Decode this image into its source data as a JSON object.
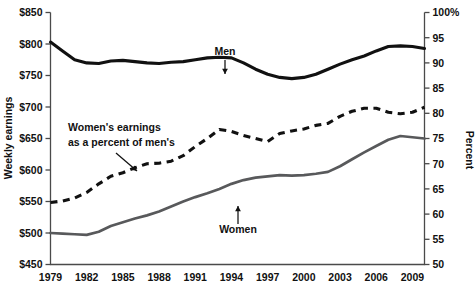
{
  "chart_data": {
    "type": "line",
    "title": "",
    "xlabel": "",
    "ylabel": "Weekly earnings",
    "y2label": "Percent",
    "ylim": [
      450,
      850
    ],
    "y2lim": [
      50,
      100
    ],
    "xlim": [
      1979,
      2010
    ],
    "grid": false,
    "legend_position": "inline-annotations",
    "y_ticks": [
      "$450",
      "$500",
      "$550",
      "$600",
      "$650",
      "$700",
      "$750",
      "$800",
      "$850"
    ],
    "y_tick_values": [
      450,
      500,
      550,
      600,
      650,
      700,
      750,
      800,
      850
    ],
    "y2_ticks": [
      "50",
      "55",
      "60",
      "65",
      "70",
      "75",
      "80",
      "85",
      "90",
      "95",
      "100%"
    ],
    "y2_tick_values": [
      50,
      55,
      60,
      65,
      70,
      75,
      80,
      85,
      90,
      95,
      100
    ],
    "x_ticks": [
      "1979",
      "1982",
      "1985",
      "1988",
      "1991",
      "1994",
      "1997",
      "2000",
      "2003",
      "2006",
      "2009"
    ],
    "x": [
      1979,
      1980,
      1981,
      1982,
      1983,
      1984,
      1985,
      1986,
      1987,
      1988,
      1989,
      1990,
      1991,
      1992,
      1993,
      1994,
      1995,
      1996,
      1997,
      1998,
      1999,
      2000,
      2001,
      2002,
      2003,
      2004,
      2005,
      2006,
      2007,
      2008,
      2009,
      2010
    ],
    "series": [
      {
        "name": "Men",
        "axis": "left",
        "style": "solid-black",
        "values": [
          803,
          789,
          775,
          770,
          769,
          773,
          774,
          772,
          770,
          769,
          771,
          772,
          775,
          778,
          779,
          778,
          770,
          760,
          752,
          747,
          745,
          747,
          752,
          760,
          768,
          775,
          781,
          789,
          796,
          797,
          796,
          793
        ]
      },
      {
        "name": "Women",
        "axis": "left",
        "style": "solid-gray",
        "values": [
          500,
          499,
          498,
          497,
          502,
          511,
          517,
          523,
          528,
          534,
          542,
          550,
          557,
          563,
          570,
          578,
          584,
          588,
          590,
          592,
          591,
          592,
          594,
          597,
          606,
          617,
          628,
          638,
          648,
          654,
          652,
          650
        ]
      },
      {
        "name": "Women's earnings as a percent of men's",
        "axis": "right",
        "style": "dashed-black",
        "values": [
          62.3,
          62.6,
          63.2,
          64.3,
          66.0,
          67.5,
          68.2,
          69.2,
          70.0,
          70.1,
          70.5,
          71.6,
          73.4,
          75.0,
          76.8,
          76.4,
          75.6,
          75.0,
          74.4,
          76.0,
          76.5,
          76.9,
          77.6,
          78.0,
          79.4,
          80.4,
          81.0,
          81.0,
          80.2,
          79.9,
          80.2,
          81.2
        ]
      }
    ],
    "annotations": [
      {
        "text": "Men",
        "arrow": "down",
        "target_series": "Men"
      },
      {
        "text": "Women",
        "arrow": "up",
        "target_series": "Women"
      },
      {
        "text": "Women's earnings",
        "text2": "as a percent of men's",
        "arrow": "diagonal-down-right",
        "target_series": "Women's earnings as a percent of men's"
      }
    ]
  },
  "axes": {
    "left_title": "Weekly earnings",
    "right_title": "Percent"
  }
}
